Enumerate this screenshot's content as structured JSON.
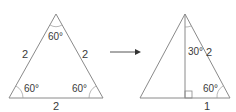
{
  "left_triangle": {
    "name": "equilateral-triangle",
    "side_left": "2",
    "side_right": "2",
    "side_base": "2",
    "angle_top": "60°",
    "angle_bottom_left": "60°",
    "angle_bottom_right": "60°"
  },
  "arrow": {
    "direction": "right"
  },
  "right_triangle": {
    "name": "bisected-triangle",
    "angle_top": "30°",
    "hypotenuse": "2",
    "angle_bottom_right": "60°",
    "half_base": "1"
  },
  "colors": {
    "lines": "#8a8a8a",
    "text": "#3a3a3a",
    "arrow": "#333333"
  }
}
